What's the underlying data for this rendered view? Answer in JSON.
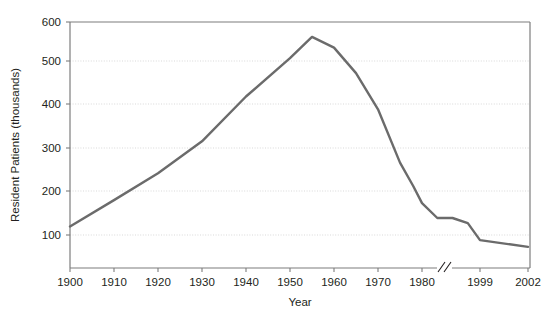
{
  "chart_data": {
    "type": "line",
    "title": "",
    "xlabel": "Year",
    "ylabel": "Resident Patients (thousands)",
    "ylim": [
      0,
      600
    ],
    "y_ticks": [
      100,
      200,
      300,
      400,
      500,
      600
    ],
    "y_tick_labels": [
      "100",
      "200",
      "300",
      "400",
      "500",
      "600"
    ],
    "x_tick_labels": [
      "1900",
      "1910",
      "1920",
      "1930",
      "1940",
      "1950",
      "1960",
      "1970",
      "1980",
      "1999",
      "2002"
    ],
    "x_axis_break": {
      "present": true,
      "symbol": "//",
      "between": [
        "1980",
        "1999"
      ]
    },
    "grid": "horizontal-dotted",
    "legend": "none",
    "series": [
      {
        "name": "Resident Patients",
        "color": "#6b6b6b",
        "x": [
          1900,
          1910,
          1920,
          1930,
          1940,
          1950,
          1955,
          1960,
          1965,
          1970,
          1975,
          1978,
          1980,
          1985,
          1990,
          1995,
          1999,
          2002
        ],
        "values": [
          120,
          182,
          245,
          320,
          425,
          515,
          565,
          540,
          480,
          395,
          270,
          215,
          175,
          140,
          140,
          128,
          88,
          72
        ]
      }
    ]
  },
  "axes": {
    "y_label": "Resident Patients (thousands)",
    "x_label": "Year"
  }
}
